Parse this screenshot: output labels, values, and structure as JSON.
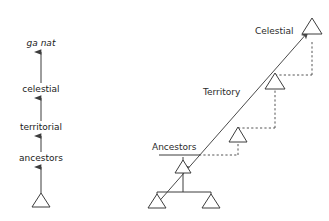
{
  "figure": {
    "kind": "diagram",
    "background_color": "#ffffff",
    "line_color": "#3d3d3d",
    "text_color": "#1a1a1a",
    "dashed_color": "#555555"
  },
  "left_panel": {
    "name": "vertical-hierarchy-axis",
    "axis_x": 41,
    "levels": [
      {
        "label": "ga nat",
        "style": "italic",
        "y": 46,
        "arrow_to_y": 40
      },
      {
        "label": "celestial",
        "style": "normal",
        "y": 92,
        "arrow_to_y": 86
      },
      {
        "label": "territorial",
        "style": "normal",
        "y": 130,
        "arrow_to_y": 124
      },
      {
        "label": "ancestors",
        "style": "normal",
        "y": 161,
        "arrow_to_y": 155
      }
    ],
    "base_marker": {
      "shape": "open-triangle",
      "cx": 41,
      "cy": 207,
      "half_width": 9,
      "height": 14
    }
  },
  "right_panel": {
    "name": "segmentary-lineage-staircase",
    "diagonal": {
      "from_x": 155,
      "from_y": 205,
      "to_x": 311,
      "to_y": 29,
      "arrowhead": "up-right"
    },
    "labels": [
      {
        "text": "Celestial",
        "x": 255,
        "y": 34,
        "anchor": "start"
      },
      {
        "text": "Territory",
        "x": 203,
        "y": 95,
        "anchor": "start"
      },
      {
        "text": "Ancestors",
        "x": 152,
        "y": 150,
        "anchor": "start"
      }
    ],
    "nodes": [
      {
        "name": "root-celestial-triangle",
        "cx": 312,
        "cy": 26,
        "half_width": 10,
        "height": 16
      },
      {
        "name": "territory-triangle",
        "cx": 275,
        "cy": 89,
        "half_width": 10,
        "height": 16
      },
      {
        "name": "ancestors-upper-triangle",
        "cx": 238,
        "cy": 142,
        "half_width": 9,
        "height": 15
      },
      {
        "name": "lineage-head-triangle",
        "cx": 183,
        "cy": 173,
        "half_width": 8,
        "height": 13
      },
      {
        "name": "lineage-leaf-left-triangle",
        "cx": 157,
        "cy": 208,
        "half_width": 9,
        "height": 14
      },
      {
        "name": "lineage-leaf-right-triangle",
        "cx": 211,
        "cy": 208,
        "half_width": 9,
        "height": 14
      }
    ],
    "step_lines": [
      {
        "name": "ancestors-tread",
        "type": "solid",
        "x1": 159,
        "y1": 155,
        "x2": 200,
        "y2": 155
      },
      {
        "name": "ancestors-tread-dashed",
        "type": "dashed",
        "x1": 200,
        "y1": 155,
        "x2": 238,
        "y2": 155
      },
      {
        "name": "ancestors-riser",
        "type": "dashed",
        "x1": 238,
        "y1": 155,
        "x2": 238,
        "y2": 128
      },
      {
        "name": "territory-tread",
        "type": "dashed",
        "x1": 238,
        "y1": 128,
        "x2": 275,
        "y2": 128
      },
      {
        "name": "territory-riser",
        "type": "dashed",
        "x1": 275,
        "y1": 128,
        "x2": 275,
        "y2": 75
      },
      {
        "name": "celestial-tread",
        "type": "dashed",
        "x1": 275,
        "y1": 75,
        "x2": 312,
        "y2": 75
      },
      {
        "name": "celestial-riser",
        "type": "dashed",
        "x1": 312,
        "y1": 75,
        "x2": 312,
        "y2": 42
      }
    ],
    "lineage_tree": [
      {
        "name": "tree-stem",
        "x1": 183,
        "y1": 173,
        "x2": 183,
        "y2": 192
      },
      {
        "name": "tree-crossbar",
        "x1": 157,
        "y1": 192,
        "x2": 211,
        "y2": 192
      },
      {
        "name": "tree-branch-left",
        "x1": 157,
        "y1": 192,
        "x2": 157,
        "y2": 208
      },
      {
        "name": "tree-branch-right",
        "x1": 211,
        "y1": 192,
        "x2": 211,
        "y2": 208
      },
      {
        "name": "lineage-head-riser",
        "x1": 183,
        "y1": 155,
        "x2": 183,
        "y2": 168
      }
    ]
  }
}
